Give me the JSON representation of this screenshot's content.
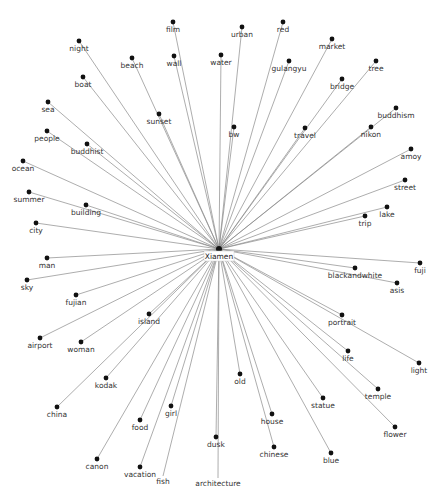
{
  "diagram": {
    "type": "star-network",
    "center": {
      "label": "Xiamen",
      "x": 219,
      "y": 249
    },
    "edge_color": "#8a8a8a",
    "node_color": "#111111",
    "label_color": "#333333",
    "nodes": [
      {
        "label": "film",
        "x": 173,
        "y": 22,
        "dot": true
      },
      {
        "label": "night",
        "x": 79,
        "y": 41,
        "dot": true
      },
      {
        "label": "beach",
        "x": 132,
        "y": 58,
        "dot": true
      },
      {
        "label": "wall",
        "x": 174,
        "y": 56,
        "dot": true
      },
      {
        "label": "water",
        "x": 221,
        "y": 55,
        "dot": true
      },
      {
        "label": "urban",
        "x": 242,
        "y": 27,
        "dot": true
      },
      {
        "label": "red",
        "x": 283,
        "y": 22,
        "dot": true
      },
      {
        "label": "gulangyu",
        "x": 289,
        "y": 61,
        "dot": true
      },
      {
        "label": "market",
        "x": 332,
        "y": 39,
        "dot": true
      },
      {
        "label": "tree",
        "x": 376,
        "y": 61,
        "dot": true
      },
      {
        "label": "bridge",
        "x": 342,
        "y": 79,
        "dot": true
      },
      {
        "label": "boat",
        "x": 83,
        "y": 77,
        "dot": true
      },
      {
        "label": "sea",
        "x": 48,
        "y": 102,
        "dot": true
      },
      {
        "label": "sunset",
        "x": 159,
        "y": 114,
        "dot": true
      },
      {
        "label": "bw",
        "x": 234,
        "y": 127,
        "dot": true
      },
      {
        "label": "travel",
        "x": 305,
        "y": 128,
        "dot": true
      },
      {
        "label": "buddhism",
        "x": 396,
        "y": 108,
        "dot": true
      },
      {
        "label": "nikon",
        "x": 371,
        "y": 127,
        "dot": true
      },
      {
        "label": "people",
        "x": 47,
        "y": 131,
        "dot": true
      },
      {
        "label": "buddhist",
        "x": 87,
        "y": 144,
        "dot": true
      },
      {
        "label": "ocean",
        "x": 23,
        "y": 161,
        "dot": true
      },
      {
        "label": "amoy",
        "x": 411,
        "y": 149,
        "dot": true
      },
      {
        "label": "summer",
        "x": 29,
        "y": 192,
        "dot": true
      },
      {
        "label": "street",
        "x": 405,
        "y": 180,
        "dot": true
      },
      {
        "label": "building",
        "x": 86,
        "y": 205,
        "dot": true
      },
      {
        "label": "lake",
        "x": 387,
        "y": 207,
        "dot": true
      },
      {
        "label": "trip",
        "x": 365,
        "y": 216,
        "dot": true
      },
      {
        "label": "city",
        "x": 36,
        "y": 223,
        "dot": true
      },
      {
        "label": "man",
        "x": 47,
        "y": 258,
        "dot": true
      },
      {
        "label": "fuji",
        "x": 420,
        "y": 263,
        "dot": true
      },
      {
        "label": "blackandwhite",
        "x": 355,
        "y": 268,
        "dot": true
      },
      {
        "label": "sky",
        "x": 27,
        "y": 280,
        "dot": true
      },
      {
        "label": "asis",
        "x": 397,
        "y": 283,
        "dot": true
      },
      {
        "label": "fujian",
        "x": 76,
        "y": 295,
        "dot": true
      },
      {
        "label": "portrait",
        "x": 342,
        "y": 315,
        "dot": true
      },
      {
        "label": "island",
        "x": 149,
        "y": 314,
        "dot": true
      },
      {
        "label": "airport",
        "x": 40,
        "y": 338,
        "dot": true
      },
      {
        "label": "woman",
        "x": 81,
        "y": 342,
        "dot": true
      },
      {
        "label": "life",
        "x": 348,
        "y": 351,
        "dot": true
      },
      {
        "label": "light",
        "x": 419,
        "y": 363,
        "dot": true
      },
      {
        "label": "kodak",
        "x": 106,
        "y": 378,
        "dot": true
      },
      {
        "label": "old",
        "x": 240,
        "y": 374,
        "dot": true
      },
      {
        "label": "temple",
        "x": 378,
        "y": 389,
        "dot": true
      },
      {
        "label": "statue",
        "x": 323,
        "y": 398,
        "dot": true
      },
      {
        "label": "china",
        "x": 57,
        "y": 407,
        "dot": true
      },
      {
        "label": "food",
        "x": 140,
        "y": 420,
        "dot": true
      },
      {
        "label": "girl",
        "x": 171,
        "y": 406,
        "dot": true
      },
      {
        "label": "house",
        "x": 272,
        "y": 414,
        "dot": true
      },
      {
        "label": "flower",
        "x": 395,
        "y": 427,
        "dot": true
      },
      {
        "label": "dusk",
        "x": 216,
        "y": 437,
        "dot": true
      },
      {
        "label": "chinese",
        "x": 274,
        "y": 447,
        "dot": true
      },
      {
        "label": "blue",
        "x": 331,
        "y": 453,
        "dot": true
      },
      {
        "label": "canon",
        "x": 97,
        "y": 459,
        "dot": true
      },
      {
        "label": "vacation",
        "x": 140,
        "y": 467,
        "dot": true
      },
      {
        "label": "fish",
        "x": 163,
        "y": 476,
        "dot": false
      },
      {
        "label": "architecture",
        "x": 218,
        "y": 478,
        "dot": false
      }
    ]
  }
}
